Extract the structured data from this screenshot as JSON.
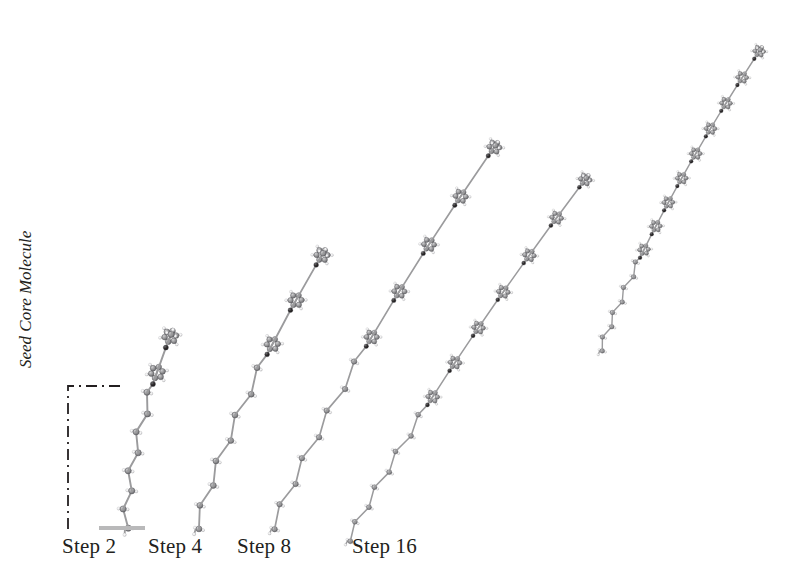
{
  "figure": {
    "background_color": "#ffffff",
    "ink_color": "#231f20",
    "atom_colors": {
      "carbon": "#8e8e90",
      "hydrogen": "#f2f2f2",
      "heteroatom": "#231f20",
      "bond": "#9b9b9d",
      "outline": "#4a4a4c"
    },
    "substrate_color": "#b9b9ba"
  },
  "annotations": {
    "seed_core_label": "Seed Core Molecule",
    "bracket": {
      "style": "dash-dot",
      "color": "#231f20"
    }
  },
  "steps": [
    {
      "label": "Step 2",
      "label_x": 62,
      "label_y": 534
    },
    {
      "label": "Step 4",
      "label_x": 148,
      "label_y": 534
    },
    {
      "label": "Step 8",
      "label_x": 237,
      "label_y": 534
    },
    {
      "label": "Step 16",
      "label_x": 352,
      "label_y": 534
    }
  ],
  "chart_data": {
    "type": "diagram",
    "title": "",
    "categories": [
      "Step 2",
      "Step 4",
      "Step 8",
      "Step 16",
      "Step 16 (extended)"
    ],
    "values": [
      160,
      300,
      440,
      520,
      560
    ],
    "ylabel": "Chain contour length (px)",
    "xlabel": "Growth step",
    "molecules": [
      {
        "name": "Step 2",
        "aromatic_rings": 2,
        "alkyl_units": 8,
        "base": [
          125,
          528
        ],
        "tip": [
          178,
          318
        ],
        "seeded": true
      },
      {
        "name": "Step 4",
        "aromatic_rings": 3,
        "alkyl_units": 8,
        "base": [
          196,
          528
        ],
        "tip": [
          336,
          232
        ],
        "seeded": false
      },
      {
        "name": "Step 8",
        "aromatic_rings": 5,
        "alkyl_units": 8,
        "base": [
          272,
          528
        ],
        "tip": [
          512,
          122
        ],
        "seeded": false
      },
      {
        "name": "Step 16",
        "aromatic_rings": 7,
        "alkyl_units": 8,
        "base": [
          348,
          540
        ],
        "tip": [
          600,
          160
        ],
        "seeded": false
      },
      {
        "name": "Step 16 extended",
        "aromatic_rings": 9,
        "alkyl_units": 8,
        "base": [
          600,
          350
        ],
        "tip": [
          768,
          38
        ],
        "seeded": false
      }
    ]
  }
}
